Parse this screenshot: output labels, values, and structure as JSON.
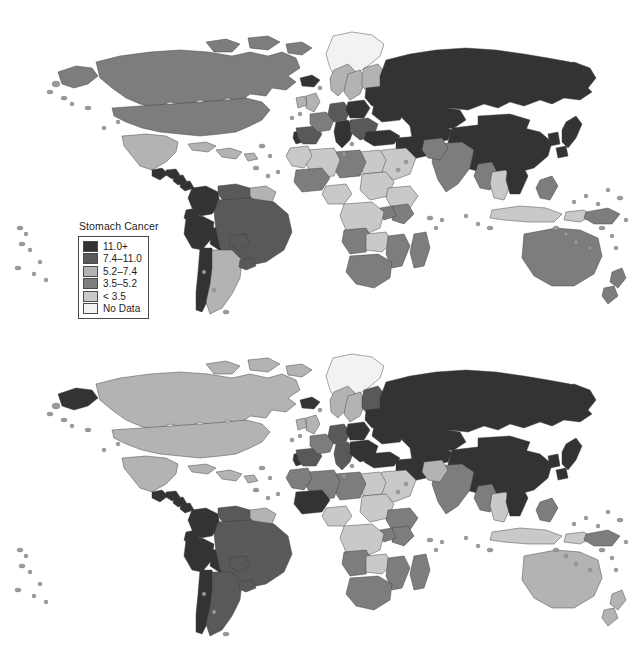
{
  "figure": {
    "background": "#ffffff",
    "type": "two-panel grayscale world choropleth"
  },
  "panels": [
    {
      "id": "incidence",
      "title_line1": "Incidence ASR",
      "title_line2": "Both Sexes",
      "legend": {
        "title": "Stomach Cancer",
        "entries": [
          {
            "label": "11.0+",
            "color": "#333333"
          },
          {
            "label": "7.4–11.0",
            "color": "#595959"
          },
          {
            "label": "5.2–7.4",
            "color": "#b3b3b3"
          },
          {
            "label": "3.5–5.2",
            "color": "#7d7d7d"
          },
          {
            "label": "< 3.5",
            "color": "#c9c9c9"
          },
          {
            "label": "No Data",
            "color": "#f2f2f2"
          }
        ]
      }
    },
    {
      "id": "mortality",
      "title_line1": "Mortality ASR",
      "title_line2": "Both Sexes",
      "legend": {
        "title": "Stomach Cancer",
        "entries": [
          {
            "label": "9.0+",
            "color": "#333333"
          },
          {
            "label": "5.6–9.0",
            "color": "#595959"
          },
          {
            "label": "4.0–5.6",
            "color": "#b3b3b3"
          },
          {
            "label": "2.8–4.0",
            "color": "#7d7d7d"
          },
          {
            "label": "< 2.8",
            "color": "#c9c9c9"
          },
          {
            "label": "No Data",
            "color": "#f2f2f2"
          }
        ]
      }
    }
  ],
  "chart_data": {
    "type": "map",
    "projection": "world equirectangular-like",
    "maps": [
      {
        "name": "Incidence ASR Both Sexes",
        "measure": "Age-standardised incidence rate (per 100,000)",
        "class_breaks": [
          "< 3.5",
          "3.5–5.2",
          "5.2–7.4",
          "7.4–11.0",
          "11.0+",
          "No Data"
        ],
        "class_colors": [
          "#c9c9c9",
          "#7d7d7d",
          "#b3b3b3",
          "#595959",
          "#333333",
          "#f2f2f2"
        ],
        "regions": [
          {
            "name": "Greenland",
            "class": "No Data"
          },
          {
            "name": "Canada",
            "class": "3.5–5.2"
          },
          {
            "name": "Alaska",
            "class": "3.5–5.2"
          },
          {
            "name": "United States",
            "class": "3.5–5.2"
          },
          {
            "name": "Iceland",
            "class": "11.0+"
          },
          {
            "name": "Mexico",
            "class": "5.2–7.4"
          },
          {
            "name": "Guatemala",
            "class": "11.0+"
          },
          {
            "name": "Honduras",
            "class": "11.0+"
          },
          {
            "name": "Nicaragua",
            "class": "11.0+"
          },
          {
            "name": "Costa Rica",
            "class": "11.0+"
          },
          {
            "name": "Cuba",
            "class": "5.2–7.4"
          },
          {
            "name": "Caribbean",
            "class": "5.2–7.4"
          },
          {
            "name": "Colombia",
            "class": "11.0+"
          },
          {
            "name": "Venezuela",
            "class": "7.4–11.0"
          },
          {
            "name": "Guianas",
            "class": "5.2–7.4"
          },
          {
            "name": "Ecuador",
            "class": "11.0+"
          },
          {
            "name": "Peru",
            "class": "11.0+"
          },
          {
            "name": "Bolivia",
            "class": "11.0+"
          },
          {
            "name": "Brazil",
            "class": "7.4–11.0"
          },
          {
            "name": "Chile",
            "class": "11.0+"
          },
          {
            "name": "Argentina",
            "class": "5.2–7.4"
          },
          {
            "name": "Uruguay",
            "class": "7.4–11.0"
          },
          {
            "name": "Paraguay",
            "class": "7.4–11.0"
          },
          {
            "name": "Portugal",
            "class": "11.0+"
          },
          {
            "name": "Spain",
            "class": "7.4–11.0"
          },
          {
            "name": "France",
            "class": "3.5–5.2"
          },
          {
            "name": "United Kingdom",
            "class": "5.2–7.4"
          },
          {
            "name": "Ireland",
            "class": "5.2–7.4"
          },
          {
            "name": "Norway",
            "class": "5.2–7.4"
          },
          {
            "name": "Sweden",
            "class": "5.2–7.4"
          },
          {
            "name": "Finland",
            "class": "5.2–7.4"
          },
          {
            "name": "Germany",
            "class": "7.4–11.0"
          },
          {
            "name": "Poland",
            "class": "11.0+"
          },
          {
            "name": "Italy",
            "class": "11.0+"
          },
          {
            "name": "Balkans",
            "class": "7.4–11.0"
          },
          {
            "name": "Belarus/Baltics",
            "class": "11.0+"
          },
          {
            "name": "Ukraine",
            "class": "11.0+"
          },
          {
            "name": "Russia",
            "class": "11.0+"
          },
          {
            "name": "Turkey",
            "class": "11.0+"
          },
          {
            "name": "Kazakhstan",
            "class": "11.0+"
          },
          {
            "name": "Central Asia",
            "class": "11.0+"
          },
          {
            "name": "China",
            "class": "11.0+"
          },
          {
            "name": "Mongolia",
            "class": "11.0+"
          },
          {
            "name": "Japan",
            "class": "11.0+"
          },
          {
            "name": "Korea",
            "class": "11.0+"
          },
          {
            "name": "India",
            "class": "3.5–5.2"
          },
          {
            "name": "Pakistan",
            "class": "3.5–5.2"
          },
          {
            "name": "Iran",
            "class": "11.0+"
          },
          {
            "name": "Saudi Arabia",
            "class": "< 3.5"
          },
          {
            "name": "Egypt",
            "class": "< 3.5"
          },
          {
            "name": "Libya",
            "class": "3.5–5.2"
          },
          {
            "name": "Algeria",
            "class": "< 3.5"
          },
          {
            "name": "Morocco",
            "class": "< 3.5"
          },
          {
            "name": "Mali",
            "class": "3.5–5.2"
          },
          {
            "name": "Nigeria",
            "class": "< 3.5"
          },
          {
            "name": "Sudan",
            "class": "< 3.5"
          },
          {
            "name": "Ethiopia",
            "class": "< 3.5"
          },
          {
            "name": "Kenya",
            "class": "3.5–5.2"
          },
          {
            "name": "Uganda",
            "class": "3.5–5.2"
          },
          {
            "name": "DR Congo",
            "class": "< 3.5"
          },
          {
            "name": "Angola",
            "class": "3.5–5.2"
          },
          {
            "name": "Zambia",
            "class": "< 3.5"
          },
          {
            "name": "Mozambique",
            "class": "3.5–5.2"
          },
          {
            "name": "South Africa",
            "class": "3.5–5.2"
          },
          {
            "name": "Madagascar",
            "class": "3.5–5.2"
          },
          {
            "name": "Myanmar",
            "class": "3.5–5.2"
          },
          {
            "name": "Thailand",
            "class": "< 3.5"
          },
          {
            "name": "Vietnam",
            "class": "11.0+"
          },
          {
            "name": "Indonesia",
            "class": "< 3.5"
          },
          {
            "name": "Philippines",
            "class": "3.5–5.2"
          },
          {
            "name": "Papua New Guinea",
            "class": "3.5–5.2"
          },
          {
            "name": "Australia",
            "class": "3.5–5.2"
          },
          {
            "name": "New Zealand",
            "class": "3.5–5.2"
          }
        ]
      },
      {
        "name": "Mortality ASR Both Sexes",
        "measure": "Age-standardised mortality rate (per 100,000)",
        "class_breaks": [
          "< 2.8",
          "2.8–4.0",
          "4.0–5.6",
          "5.6–9.0",
          "9.0+",
          "No Data"
        ],
        "class_colors": [
          "#c9c9c9",
          "#7d7d7d",
          "#b3b3b3",
          "#595959",
          "#333333",
          "#f2f2f2"
        ],
        "regions": [
          {
            "name": "Greenland",
            "class": "No Data"
          },
          {
            "name": "Canada",
            "class": "4.0–5.6"
          },
          {
            "name": "Alaska",
            "class": "9.0+"
          },
          {
            "name": "United States",
            "class": "4.0–5.6"
          },
          {
            "name": "Iceland",
            "class": "9.0+"
          },
          {
            "name": "Mexico",
            "class": "4.0–5.6"
          },
          {
            "name": "Guatemala",
            "class": "9.0+"
          },
          {
            "name": "Honduras",
            "class": "9.0+"
          },
          {
            "name": "Nicaragua",
            "class": "9.0+"
          },
          {
            "name": "Costa Rica",
            "class": "9.0+"
          },
          {
            "name": "Cuba",
            "class": "4.0–5.6"
          },
          {
            "name": "Caribbean",
            "class": "4.0–5.6"
          },
          {
            "name": "Colombia",
            "class": "9.0+"
          },
          {
            "name": "Venezuela",
            "class": "5.6–9.0"
          },
          {
            "name": "Guianas",
            "class": "4.0–5.6"
          },
          {
            "name": "Ecuador",
            "class": "9.0+"
          },
          {
            "name": "Peru",
            "class": "9.0+"
          },
          {
            "name": "Bolivia",
            "class": "9.0+"
          },
          {
            "name": "Brazil",
            "class": "5.6–9.0"
          },
          {
            "name": "Chile",
            "class": "9.0+"
          },
          {
            "name": "Argentina",
            "class": "5.6–9.0"
          },
          {
            "name": "Uruguay",
            "class": "5.6–9.0"
          },
          {
            "name": "Paraguay",
            "class": "5.6–9.0"
          },
          {
            "name": "Portugal",
            "class": "9.0+"
          },
          {
            "name": "Spain",
            "class": "5.6–9.0"
          },
          {
            "name": "France",
            "class": "2.8–4.0"
          },
          {
            "name": "United Kingdom",
            "class": "4.0–5.6"
          },
          {
            "name": "Ireland",
            "class": "4.0–5.6"
          },
          {
            "name": "Norway",
            "class": "4.0–5.6"
          },
          {
            "name": "Sweden",
            "class": "4.0–5.6"
          },
          {
            "name": "Finland",
            "class": "5.6–9.0"
          },
          {
            "name": "Germany",
            "class": "5.6–9.0"
          },
          {
            "name": "Poland",
            "class": "9.0+"
          },
          {
            "name": "Italy",
            "class": "5.6–9.0"
          },
          {
            "name": "Balkans",
            "class": "9.0+"
          },
          {
            "name": "Belarus/Baltics",
            "class": "9.0+"
          },
          {
            "name": "Ukraine",
            "class": "9.0+"
          },
          {
            "name": "Russia",
            "class": "9.0+"
          },
          {
            "name": "Turkey",
            "class": "9.0+"
          },
          {
            "name": "Kazakhstan",
            "class": "9.0+"
          },
          {
            "name": "Central Asia",
            "class": "9.0+"
          },
          {
            "name": "China",
            "class": "9.0+"
          },
          {
            "name": "Mongolia",
            "class": "9.0+"
          },
          {
            "name": "Japan",
            "class": "9.0+"
          },
          {
            "name": "Korea",
            "class": "9.0+"
          },
          {
            "name": "India",
            "class": "2.8–4.0"
          },
          {
            "name": "Pakistan",
            "class": "4.0–5.6"
          },
          {
            "name": "Iran",
            "class": "9.0+"
          },
          {
            "name": "Saudi Arabia",
            "class": "< 2.8"
          },
          {
            "name": "Egypt",
            "class": "< 2.8"
          },
          {
            "name": "Libya",
            "class": "2.8–4.0"
          },
          {
            "name": "Algeria",
            "class": "2.8–4.0"
          },
          {
            "name": "Morocco",
            "class": "2.8–4.0"
          },
          {
            "name": "Mali",
            "class": "9.0+"
          },
          {
            "name": "Nigeria",
            "class": "< 2.8"
          },
          {
            "name": "Sudan",
            "class": "< 2.8"
          },
          {
            "name": "Ethiopia",
            "class": "2.8–4.0"
          },
          {
            "name": "Kenya",
            "class": "2.8–4.0"
          },
          {
            "name": "Uganda",
            "class": "2.8–4.0"
          },
          {
            "name": "DR Congo",
            "class": "< 2.8"
          },
          {
            "name": "Angola",
            "class": "2.8–4.0"
          },
          {
            "name": "Zambia",
            "class": "< 2.8"
          },
          {
            "name": "Mozambique",
            "class": "2.8–4.0"
          },
          {
            "name": "South Africa",
            "class": "2.8–4.0"
          },
          {
            "name": "Madagascar",
            "class": "2.8–4.0"
          },
          {
            "name": "Myanmar",
            "class": "2.8–4.0"
          },
          {
            "name": "Thailand",
            "class": "< 2.8"
          },
          {
            "name": "Vietnam",
            "class": "9.0+"
          },
          {
            "name": "Indonesia",
            "class": "< 2.8"
          },
          {
            "name": "Philippines",
            "class": "2.8–4.0"
          },
          {
            "name": "Papua New Guinea",
            "class": "2.8–4.0"
          },
          {
            "name": "Australia",
            "class": "4.0–5.6"
          },
          {
            "name": "New Zealand",
            "class": "4.0–5.6"
          }
        ]
      }
    ]
  }
}
